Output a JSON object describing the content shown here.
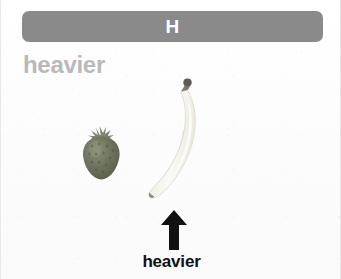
{
  "canvas": {
    "width": 341,
    "height": 279,
    "background_color": "#fdfdfd",
    "border_color": "#e8e8e8"
  },
  "header": {
    "title": "H",
    "bar_color": "#8a8a8a",
    "title_color": "#ffffff"
  },
  "top_caption": {
    "text": "heavier",
    "color": "#b9b9b9"
  },
  "fruits": [
    {
      "name": "strawberry",
      "icon": "strawberry-icon",
      "body_color": "#6f7463",
      "shade_color": "#5a6050",
      "highlight_color": "#8b9079",
      "leaf_color": "#7e8568",
      "seed_color": "#4e5345",
      "position": {
        "x": 78,
        "y": 124,
        "width": 46,
        "height": 58
      }
    },
    {
      "name": "banana",
      "icon": "banana-icon",
      "body_color": "#f3f2ec",
      "shade_color": "#e2e1d6",
      "highlight_color": "#fbfbf6",
      "edge_color": "#dedcd0",
      "stem_color": "#5e5b52",
      "tip_color": "#8d8a80",
      "position": {
        "x": 141,
        "y": 78,
        "width": 66,
        "height": 125
      }
    }
  ],
  "arrow": {
    "icon": "arrow-up-icon",
    "direction": "up",
    "color": "#111111",
    "points_to": "banana"
  },
  "bottom_caption": {
    "text": "heavier",
    "color": "#111111"
  }
}
